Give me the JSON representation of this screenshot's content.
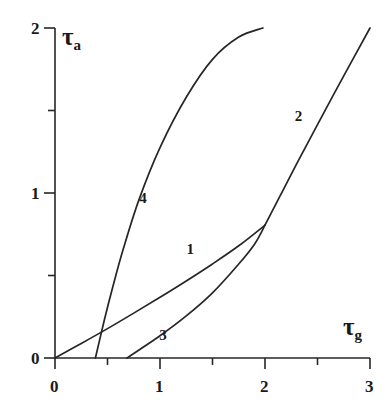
{
  "chart_data": {
    "type": "line",
    "title": "",
    "xlabel": "tau_g",
    "ylabel": "tau_a",
    "xlabel_display": "τ",
    "xlabel_sub": "g",
    "ylabel_display": "τ",
    "ylabel_sub": "a",
    "xlim": [
      0,
      3
    ],
    "ylim": [
      0,
      2
    ],
    "grid": false,
    "legend": "inline-curve-numbers",
    "xticks": [
      0,
      0.5,
      1,
      1.5,
      2,
      2.5,
      3
    ],
    "xticklabels": [
      "0",
      "",
      "1",
      "",
      "2",
      "",
      "3"
    ],
    "yticks": [
      0,
      0.5,
      1,
      1.5,
      2
    ],
    "yticklabels": [
      "0",
      "",
      "1",
      "",
      "2"
    ],
    "series": [
      {
        "name": "1",
        "label": "1",
        "label_x": 1.3,
        "label_y": 0.655,
        "points": [
          [
            0.0,
            0.0
          ],
          [
            0.25,
            0.088
          ],
          [
            0.5,
            0.178
          ],
          [
            0.75,
            0.272
          ],
          [
            1.0,
            0.368
          ],
          [
            1.25,
            0.467
          ],
          [
            1.5,
            0.57
          ],
          [
            1.75,
            0.68
          ],
          [
            2.0,
            0.805
          ]
        ]
      },
      {
        "name": "2",
        "label": "2",
        "label_x": 2.33,
        "label_y": 1.46,
        "points": [
          [
            2.0,
            0.805
          ],
          [
            2.15,
            0.99
          ],
          [
            2.3,
            1.175
          ],
          [
            2.5,
            1.415
          ],
          [
            2.75,
            1.71
          ],
          [
            3.0,
            2.0
          ]
        ]
      },
      {
        "name": "3",
        "label": "3",
        "label_x": 1.04,
        "label_y": 0.135,
        "points": [
          [
            0.685,
            0.0
          ],
          [
            1.0,
            0.135
          ],
          [
            1.25,
            0.255
          ],
          [
            1.5,
            0.395
          ],
          [
            1.75,
            0.57
          ],
          [
            1.9,
            0.69
          ],
          [
            2.0,
            0.805
          ]
        ]
      },
      {
        "name": "4",
        "label": "4",
        "label_x": 0.85,
        "label_y": 0.965,
        "points": [
          [
            0.385,
            0.0
          ],
          [
            0.47,
            0.23
          ],
          [
            0.55,
            0.43
          ],
          [
            0.65,
            0.66
          ],
          [
            0.8,
            0.96
          ],
          [
            1.0,
            1.275
          ],
          [
            1.25,
            1.58
          ],
          [
            1.5,
            1.81
          ],
          [
            1.75,
            1.945
          ],
          [
            1.98,
            2.0
          ]
        ]
      }
    ],
    "colors": {
      "curve": "#262626",
      "axis": "#262626",
      "background": "#ffffff",
      "text": "#1a1a1a"
    }
  }
}
